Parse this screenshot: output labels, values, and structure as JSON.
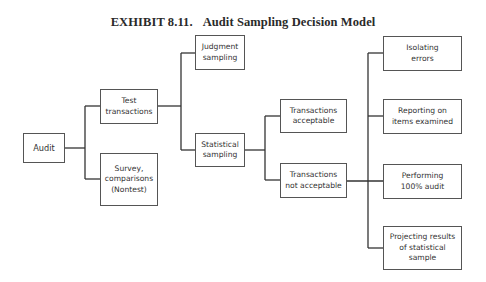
{
  "title": {
    "exhibit": "EXHIBIT 8.11.",
    "name": "Audit Sampling Decision Model"
  },
  "nodes": {
    "audit": "Audit",
    "test_transactions": "Test\ntransactions",
    "survey": "Survey,\ncomparisons\n(Nontest)",
    "judgment_sampling": "Judgment\nsampling",
    "statistical_sampling": "Statistical\nsampling",
    "transactions_acceptable": "Transactions\nacceptable",
    "transactions_not_acceptable": "Transactions\nnot acceptable",
    "isolating_errors": "Isolating\nerrors",
    "reporting_items": "Reporting on\nitems examined",
    "performing_audit": "Performing\n100% audit",
    "projecting_results": "Projecting results\nof statistical\nsample"
  },
  "edges": [
    [
      "audit",
      "test_transactions"
    ],
    [
      "audit",
      "survey"
    ],
    [
      "test_transactions",
      "judgment_sampling"
    ],
    [
      "test_transactions",
      "statistical_sampling"
    ],
    [
      "statistical_sampling",
      "transactions_acceptable"
    ],
    [
      "statistical_sampling",
      "transactions_not_acceptable"
    ],
    [
      "transactions_not_acceptable",
      "isolating_errors"
    ],
    [
      "transactions_not_acceptable",
      "reporting_items"
    ],
    [
      "transactions_not_acceptable",
      "performing_audit"
    ],
    [
      "transactions_not_acceptable",
      "projecting_results"
    ]
  ]
}
